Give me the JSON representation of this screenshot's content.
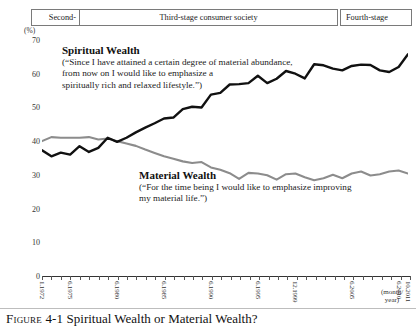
{
  "header": {
    "stages": [
      {
        "label": "Second-",
        "name": "stage-second"
      },
      {
        "label": "Third-stage consumer society",
        "name": "stage-third"
      },
      {
        "label": "Fourth-stage",
        "name": "stage-fourth"
      }
    ]
  },
  "axis": {
    "unit_label": "(%)",
    "y_ticks": [
      "70",
      "60",
      "50",
      "40",
      "30",
      "20",
      "10",
      "0"
    ],
    "x_unit": "(month/\nyear)",
    "x_unit_line1": "(month/",
    "x_unit_line2": "year)",
    "x_labels": [
      "1.1972",
      "6.1975",
      "6.1980",
      "6.1985",
      "6.1990",
      "6.1995",
      "12.1999",
      "6.2005",
      "6.2010",
      "10.2011"
    ]
  },
  "annotations": {
    "spiritual": {
      "title": "Spiritual Wealth",
      "line1": "(“Since I have attained a certain degree of material abundance,",
      "line2": "from now on I would like to emphasize a",
      "line3": "spiritually rich and relaxed lifestyle.”)"
    },
    "material": {
      "title": "Material Wealth",
      "line1": "(“For the time being I would like to emphasize improving",
      "line2": "my material life.”)"
    }
  },
  "caption": {
    "figure_number": "Figure 4-1",
    "title": "Spiritual Wealth or Material Wealth?"
  },
  "colors": {
    "spiritual_line": "#111111",
    "material_line": "#8c8c8c",
    "axis": "#333333",
    "box_border": "#7a7a7a"
  },
  "chart_data": {
    "type": "line",
    "title": "Spiritual Wealth or Material Wealth?",
    "xlabel": "(month/year)",
    "ylabel": "(%)",
    "ylim": [
      0,
      70
    ],
    "grid": false,
    "legend": "inline-annotations",
    "x": [
      "1.1972",
      "1973",
      "1974",
      "6.1975",
      "1976",
      "1977",
      "1978",
      "1979",
      "6.1980",
      "1981",
      "1982",
      "1983",
      "1984",
      "6.1985",
      "1986",
      "1987",
      "1988",
      "1989",
      "6.1990",
      "1991",
      "1992",
      "1993",
      "1994",
      "6.1995",
      "1996",
      "1997",
      "1998",
      "12.1999",
      "2000",
      "2001",
      "2002",
      "2003",
      "2004",
      "6.2005",
      "2006",
      "2007",
      "2008",
      "2009",
      "6.2010",
      "10.2011"
    ],
    "series": [
      {
        "name": "Spiritual Wealth",
        "color": "#111111",
        "values": [
          37.3,
          35.5,
          36.6,
          36.0,
          38.5,
          36.8,
          38.0,
          41.0,
          39.8,
          41.0,
          42.6,
          44.0,
          45.3,
          46.7,
          47.0,
          49.5,
          50.2,
          50.0,
          53.8,
          54.3,
          56.8,
          56.9,
          57.2,
          59.4,
          57.2,
          58.5,
          60.8,
          60.0,
          58.6,
          62.8,
          62.5,
          61.5,
          61.0,
          62.3,
          62.7,
          62.6,
          61.0,
          60.5,
          62.0,
          65.8
        ]
      },
      {
        "name": "Material Wealth",
        "color": "#8c8c8c",
        "values": [
          40.0,
          41.2,
          41.0,
          41.0,
          41.0,
          41.2,
          40.5,
          40.8,
          40.0,
          39.3,
          38.6,
          37.5,
          36.5,
          35.5,
          34.8,
          34.0,
          33.5,
          33.8,
          32.2,
          31.5,
          30.5,
          28.8,
          30.6,
          30.4,
          29.9,
          28.6,
          30.2,
          30.4,
          29.3,
          28.4,
          29.0,
          30.0,
          29.0,
          30.4,
          31.0,
          29.8,
          30.2,
          31.0,
          31.3,
          30.4
        ]
      }
    ]
  }
}
